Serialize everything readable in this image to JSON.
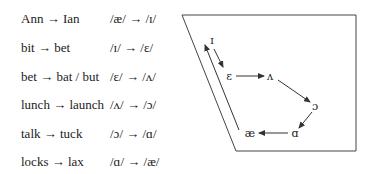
{
  "table": {
    "rows": [
      {
        "words": "Ann → Ian",
        "ipa": "/æ/ → /ɪ/"
      },
      {
        "words": "bit → bet",
        "ipa": "/ɪ/ → /ɛ/"
      },
      {
        "words": "bet → bat / but",
        "ipa": "/ɛ/ → /ʌ/"
      },
      {
        "words": "lunch → launch",
        "ipa": "/ʌ/ → /ɔ/"
      },
      {
        "words": "talk → tuck",
        "ipa": "/ɔ/ → /ɑ/"
      },
      {
        "words": "locks → lax",
        "ipa": "/ɑ/ → /æ/"
      }
    ]
  },
  "diagram": {
    "vowels": {
      "i": "ɪ",
      "e": "ɛ",
      "v": "ʌ",
      "o": "ɔ",
      "a": "ɑ",
      "ae": "æ"
    },
    "line_color": "#333333"
  }
}
